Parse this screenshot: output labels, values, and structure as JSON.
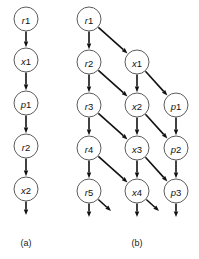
{
  "figure": {
    "background_color": "#ffffff",
    "node_fill": "#ffffff",
    "node_stroke": "#4a4a4a",
    "edge_color": "#111111",
    "label_color": "#111111",
    "node_radius": 12
  },
  "panels": [
    {
      "id": "a",
      "caption": "(a)",
      "caption_x": 26,
      "caption_y": 246,
      "nodes": [
        {
          "id": "a-r1",
          "label": "r1",
          "prefix": "r",
          "index": "1",
          "x": 26,
          "y": 19
        },
        {
          "id": "a-x1",
          "label": "x1",
          "prefix": "x",
          "index": "1",
          "x": 26,
          "y": 60
        },
        {
          "id": "a-p1",
          "label": "p1",
          "prefix": "p",
          "index": "1",
          "x": 26,
          "y": 103
        },
        {
          "id": "a-r2",
          "label": "r2",
          "prefix": "r",
          "index": "2",
          "x": 26,
          "y": 146
        },
        {
          "id": "a-x2",
          "label": "x2",
          "prefix": "x",
          "index": "2",
          "x": 26,
          "y": 189
        }
      ],
      "edges": [
        {
          "id": "a-e1",
          "from": "a-r1",
          "to": "a-x1",
          "kind": "vertical"
        },
        {
          "id": "a-e2",
          "from": "a-x1",
          "to": "a-p1",
          "kind": "vertical"
        },
        {
          "id": "a-e3",
          "from": "a-p1",
          "to": "a-r2",
          "kind": "vertical"
        },
        {
          "id": "a-e4",
          "from": "a-r2",
          "to": "a-x2",
          "kind": "vertical"
        }
      ],
      "dangling_edges": [
        {
          "id": "a-d1",
          "from": "a-x2",
          "dx": 0,
          "dy": 26
        }
      ]
    },
    {
      "id": "b",
      "caption": "(b)",
      "caption_x": 137,
      "caption_y": 246,
      "nodes": [
        {
          "id": "b-r1",
          "label": "r1",
          "prefix": "r",
          "index": "1",
          "x": 89,
          "y": 19
        },
        {
          "id": "b-r2",
          "label": "r2",
          "prefix": "r",
          "index": "2",
          "x": 89,
          "y": 62
        },
        {
          "id": "b-x1",
          "label": "x1",
          "prefix": "x",
          "index": "1",
          "x": 137,
          "y": 62
        },
        {
          "id": "b-r3",
          "label": "r3",
          "prefix": "r",
          "index": "3",
          "x": 89,
          "y": 105
        },
        {
          "id": "b-x2",
          "label": "x2",
          "prefix": "x",
          "index": "2",
          "x": 137,
          "y": 105
        },
        {
          "id": "b-p1",
          "label": "p1",
          "prefix": "p",
          "index": "1",
          "x": 176,
          "y": 105
        },
        {
          "id": "b-r4",
          "label": "r4",
          "prefix": "r",
          "index": "4",
          "x": 89,
          "y": 148
        },
        {
          "id": "b-x3",
          "label": "x3",
          "prefix": "x",
          "index": "3",
          "x": 137,
          "y": 148
        },
        {
          "id": "b-p2",
          "label": "p2",
          "prefix": "p",
          "index": "2",
          "x": 176,
          "y": 148
        },
        {
          "id": "b-r5",
          "label": "r5",
          "prefix": "r",
          "index": "5",
          "x": 89,
          "y": 191
        },
        {
          "id": "b-x4",
          "label": "x4",
          "prefix": "x",
          "index": "4",
          "x": 137,
          "y": 191
        },
        {
          "id": "b-p3",
          "label": "p3",
          "prefix": "p",
          "index": "3",
          "x": 176,
          "y": 191
        }
      ],
      "edges": [
        {
          "id": "b-e1",
          "from": "b-r1",
          "to": "b-r2",
          "kind": "vertical"
        },
        {
          "id": "b-e2",
          "from": "b-r1",
          "to": "b-x1",
          "kind": "diagonal"
        },
        {
          "id": "b-e3",
          "from": "b-r2",
          "to": "b-r3",
          "kind": "vertical"
        },
        {
          "id": "b-e4",
          "from": "b-r2",
          "to": "b-x2",
          "kind": "diagonal"
        },
        {
          "id": "b-e5",
          "from": "b-x1",
          "to": "b-x2",
          "kind": "vertical"
        },
        {
          "id": "b-e6",
          "from": "b-x1",
          "to": "b-p1",
          "kind": "diagonal"
        },
        {
          "id": "b-e7",
          "from": "b-r3",
          "to": "b-r4",
          "kind": "vertical"
        },
        {
          "id": "b-e8",
          "from": "b-r3",
          "to": "b-x3",
          "kind": "diagonal"
        },
        {
          "id": "b-e9",
          "from": "b-x2",
          "to": "b-x3",
          "kind": "vertical"
        },
        {
          "id": "b-e10",
          "from": "b-x2",
          "to": "b-p2",
          "kind": "diagonal"
        },
        {
          "id": "b-e11",
          "from": "b-p1",
          "to": "b-p2",
          "kind": "vertical"
        },
        {
          "id": "b-e12",
          "from": "b-r4",
          "to": "b-r5",
          "kind": "vertical"
        },
        {
          "id": "b-e13",
          "from": "b-r4",
          "to": "b-x4",
          "kind": "diagonal"
        },
        {
          "id": "b-e14",
          "from": "b-x3",
          "to": "b-x4",
          "kind": "vertical"
        },
        {
          "id": "b-e15",
          "from": "b-x3",
          "to": "b-p3",
          "kind": "diagonal"
        },
        {
          "id": "b-e16",
          "from": "b-p2",
          "to": "b-p3",
          "kind": "vertical"
        }
      ],
      "dangling_edges": [
        {
          "id": "b-d1",
          "from": "b-r5",
          "dx": 0,
          "dy": 26
        },
        {
          "id": "b-d2",
          "from": "b-r5",
          "dx": 22,
          "dy": 20
        },
        {
          "id": "b-d3",
          "from": "b-x4",
          "dx": 0,
          "dy": 26
        },
        {
          "id": "b-d4",
          "from": "b-x4",
          "dx": 22,
          "dy": 20
        },
        {
          "id": "b-d5",
          "from": "b-p3",
          "dx": 0,
          "dy": 26
        }
      ]
    }
  ]
}
